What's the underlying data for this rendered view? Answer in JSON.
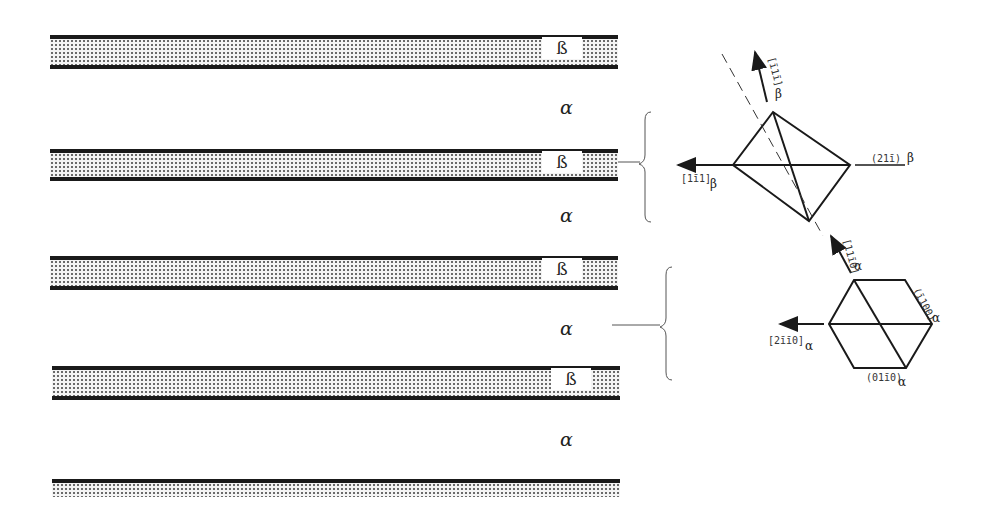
{
  "layers": [
    {
      "phase": "beta",
      "label": "ß",
      "top": 35
    },
    {
      "phase": "alpha",
      "label": "α",
      "top": 100
    },
    {
      "phase": "beta",
      "label": "ß",
      "top": 150
    },
    {
      "phase": "alpha",
      "label": "α",
      "top": 210
    },
    {
      "phase": "beta",
      "label": "ß",
      "top": 256
    },
    {
      "phase": "alpha",
      "label": "α",
      "top": 323
    },
    {
      "phase": "beta",
      "label": "ß",
      "top": 367
    },
    {
      "phase": "alpha",
      "label": "α",
      "top": 432
    },
    {
      "phase": "beta",
      "label": "",
      "top": 482
    }
  ],
  "beta_cell": {
    "labels": {
      "top_arrow": "[ī1ī]",
      "top_arrow_sub": "β",
      "left_arrow": "[1ī1]",
      "left_arrow_sub": "β",
      "right_plane": "(21ī)",
      "right_plane_sub": "β"
    }
  },
  "alpha_cell": {
    "labels": {
      "top_arrow": "[11ī0]",
      "top_arrow_sub": "α",
      "left_arrow": "[2īī0]",
      "left_arrow_sub": "α",
      "right_plane": "(ī100)",
      "right_plane_sub": "α",
      "bottom_plane": "(01ī0)",
      "bottom_plane_sub": "α"
    }
  }
}
